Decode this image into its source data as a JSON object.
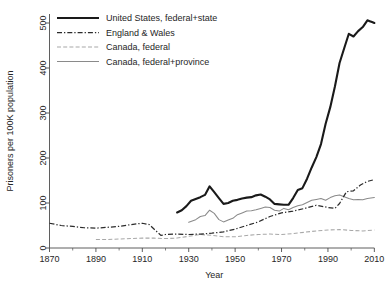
{
  "chart_data": {
    "type": "line",
    "title": "",
    "xlabel": "Year",
    "ylabel": "Prisoners per 100K population",
    "xlim": [
      1870,
      2012
    ],
    "ylim": [
      0,
      520
    ],
    "xticks": [
      1870,
      1890,
      1910,
      1930,
      1950,
      1970,
      1990,
      2010
    ],
    "xtick_labels": [
      "1870",
      "1890",
      "1910",
      "1930",
      "1950",
      "1970",
      "1990",
      "2010"
    ],
    "yticks": [
      0,
      100,
      200,
      300,
      400,
      500
    ],
    "ytick_labels": [
      "0",
      "100",
      "200",
      "300",
      "400",
      "500"
    ],
    "grid": false,
    "legend_position": "top-left",
    "series": [
      {
        "name": "United States, federal+state",
        "style": "solid-thick",
        "color": "#1a1a1a",
        "x": [
          1925,
          1927,
          1929,
          1931,
          1933,
          1935,
          1937,
          1939,
          1941,
          1943,
          1945,
          1947,
          1949,
          1951,
          1953,
          1955,
          1957,
          1959,
          1961,
          1963,
          1965,
          1967,
          1969,
          1971,
          1973,
          1975,
          1977,
          1979,
          1981,
          1983,
          1985,
          1987,
          1989,
          1991,
          1993,
          1995,
          1997,
          1999,
          2001,
          2003,
          2005,
          2007,
          2008,
          2009,
          2010
        ],
        "values": [
          79,
          84,
          93,
          105,
          109,
          113,
          118,
          137,
          124,
          111,
          98,
          100,
          105,
          107,
          110,
          112,
          113,
          117,
          119,
          114,
          108,
          98,
          97,
          96,
          96,
          111,
          129,
          133,
          154,
          179,
          202,
          231,
          276,
          313,
          359,
          411,
          444,
          476,
          470,
          482,
          491,
          506,
          504,
          502,
          500
        ]
      },
      {
        "name": "England & Wales",
        "style": "dash-dot",
        "color": "#2b2b2b",
        "x": [
          1870,
          1875,
          1880,
          1885,
          1890,
          1895,
          1900,
          1905,
          1910,
          1913,
          1918,
          1920,
          1925,
          1930,
          1935,
          1940,
          1945,
          1950,
          1955,
          1960,
          1965,
          1970,
          1975,
          1980,
          1985,
          1990,
          1993,
          1995,
          1998,
          2001,
          2004,
          2007,
          2010
        ],
        "values": [
          55,
          50,
          48,
          45,
          44,
          46,
          48,
          52,
          55,
          52,
          28,
          30,
          31,
          30,
          31,
          33,
          36,
          42,
          50,
          58,
          70,
          78,
          82,
          88,
          95,
          90,
          88,
          99,
          125,
          127,
          140,
          148,
          152
        ]
      },
      {
        "name": "Canada, federal",
        "style": "dashed-light",
        "color": "#a8a8a8",
        "x": [
          1890,
          1895,
          1900,
          1905,
          1910,
          1915,
          1920,
          1925,
          1930,
          1935,
          1940,
          1945,
          1950,
          1955,
          1960,
          1965,
          1970,
          1975,
          1980,
          1985,
          1990,
          1995,
          2000,
          2005,
          2010
        ],
        "values": [
          19,
          19,
          20,
          21,
          22,
          22,
          21,
          22,
          26,
          30,
          28,
          25,
          25,
          28,
          30,
          31,
          30,
          32,
          35,
          38,
          40,
          41,
          39,
          38,
          40
        ]
      },
      {
        "name": "Canada, federal+province",
        "style": "solid-thin",
        "color": "#8a8a8a",
        "x": [
          1930,
          1933,
          1935,
          1937,
          1939,
          1941,
          1943,
          1945,
          1947,
          1949,
          1951,
          1953,
          1955,
          1957,
          1959,
          1961,
          1963,
          1965,
          1967,
          1969,
          1971,
          1973,
          1975,
          1977,
          1979,
          1981,
          1983,
          1985,
          1987,
          1989,
          1991,
          1993,
          1995,
          1997,
          1999,
          2001,
          2003,
          2005,
          2007,
          2010
        ],
        "values": [
          57,
          63,
          70,
          72,
          84,
          77,
          63,
          58,
          62,
          66,
          74,
          78,
          82,
          83,
          85,
          88,
          91,
          90,
          84,
          82,
          88,
          85,
          90,
          94,
          96,
          101,
          106,
          108,
          110,
          106,
          112,
          116,
          118,
          114,
          110,
          107,
          108,
          107,
          110,
          112
        ]
      }
    ]
  },
  "legend": {
    "items": [
      {
        "label": "United States, federal+state"
      },
      {
        "label": "England & Wales"
      },
      {
        "label": "Canada, federal"
      },
      {
        "label": "Canada, federal+province"
      }
    ]
  }
}
